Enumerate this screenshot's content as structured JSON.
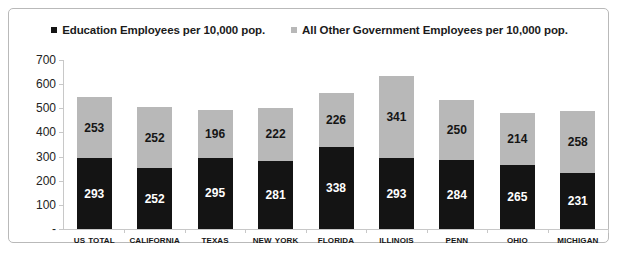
{
  "chart_data": {
    "type": "bar",
    "subtype": "stacked-vertical",
    "title": "",
    "xlabel": "",
    "ylabel": "",
    "ylim": [
      0,
      700
    ],
    "yticks": [
      "-",
      "100",
      "200",
      "300",
      "400",
      "500",
      "600",
      "700"
    ],
    "ytick_values": [
      0,
      100,
      200,
      300,
      400,
      500,
      600,
      700
    ],
    "grid": false,
    "legend_position": "top-center",
    "categories": [
      "US Total",
      "California",
      "Texas",
      "New York",
      "Florida",
      "Illinois",
      "Penn",
      "Ohio",
      "Michigan"
    ],
    "series": [
      {
        "name": "Education Employees per 10,000 pop.",
        "color": "#141414",
        "stack_position": "bottom",
        "values": [
          293,
          252,
          295,
          281,
          338,
          293,
          284,
          265,
          231
        ]
      },
      {
        "name": "All Other Government Employees per 10,000 pop.",
        "color": "#b8b8b8",
        "stack_position": "top",
        "values": [
          253,
          252,
          196,
          222,
          226,
          341,
          250,
          214,
          258
        ]
      }
    ],
    "totals": [
      546,
      504,
      491,
      503,
      564,
      634,
      534,
      479,
      489
    ]
  },
  "legend": {
    "entries": [
      {
        "label": "Education Employees per 10,000 pop.",
        "color": "#141414"
      },
      {
        "label": "All Other Government Employees per 10,000 pop.",
        "color": "#b8b8b8"
      }
    ]
  },
  "colors": {
    "education": "#141414",
    "other_government": "#b8b8b8",
    "frame_border": "#b9b9b9",
    "axis": "#c8c8c8",
    "background": "#ffffff"
  }
}
